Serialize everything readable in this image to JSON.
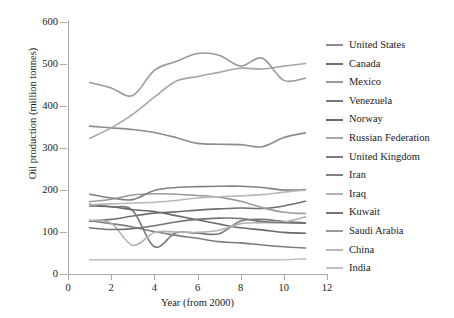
{
  "chart_data": {
    "type": "line",
    "title": "",
    "xlabel": "Year (from 2000)",
    "ylabel": "Oil production (million tonnes)",
    "xlim": [
      0,
      12
    ],
    "ylim": [
      0,
      600
    ],
    "xticks": [
      0,
      2,
      4,
      6,
      8,
      10,
      12
    ],
    "yticks": [
      0,
      100,
      200,
      300,
      400,
      500,
      600
    ],
    "grid": false,
    "legend_position": "right",
    "x": [
      1,
      2,
      3,
      4,
      5,
      6,
      7,
      8,
      9,
      10,
      11
    ],
    "series": [
      {
        "name": "United States",
        "color": "#8c8c8c",
        "values": [
          352,
          348,
          344,
          337,
          325,
          311,
          309,
          308,
          303,
          325,
          336
        ]
      },
      {
        "name": "Canada",
        "color": "#6e6e6e",
        "values": [
          126,
          130,
          138,
          145,
          148,
          152,
          155,
          157,
          156,
          162,
          173
        ]
      },
      {
        "name": "Mexico",
        "color": "#9a9a9a",
        "values": [
          172,
          178,
          188,
          191,
          190,
          187,
          183,
          173,
          158,
          147,
          144
        ]
      },
      {
        "name": "Venezuela",
        "color": "#787878",
        "values": [
          166,
          160,
          151,
          65,
          98,
          97,
          96,
          126,
          130,
          125,
          122
        ]
      },
      {
        "name": "Norway",
        "color": "#6a6a6a",
        "values": [
          162,
          160,
          153,
          149,
          139,
          129,
          119,
          110,
          105,
          99,
          97
        ]
      },
      {
        "name": "Russian Federation",
        "color": "#a6a6a6",
        "values": [
          323,
          348,
          380,
          421,
          459,
          470,
          480,
          490,
          488,
          495,
          501
        ]
      },
      {
        "name": "United Kingdom",
        "color": "#7d7d7d",
        "values": [
          127,
          120,
          112,
          101,
          92,
          85,
          77,
          74,
          69,
          65,
          62
        ]
      },
      {
        "name": "Iran",
        "color": "#808080",
        "values": [
          190,
          181,
          177,
          199,
          206,
          208,
          209,
          209,
          206,
          200,
          201
        ]
      },
      {
        "name": "Iraq",
        "color": "#b2b2b2",
        "values": [
          128,
          121,
          68,
          99,
          100,
          99,
          104,
          120,
          122,
          124,
          136
        ]
      },
      {
        "name": "Kuwait",
        "color": "#747474",
        "values": [
          110,
          106,
          108,
          115,
          124,
          130,
          133,
          132,
          125,
          122,
          121
        ]
      },
      {
        "name": "Saudi Arabia",
        "color": "#999999",
        "values": [
          456,
          443,
          425,
          485,
          506,
          525,
          521,
          495,
          514,
          461,
          466
        ]
      },
      {
        "name": "China",
        "color": "#b8b8b8",
        "values": [
          165,
          167,
          169,
          171,
          175,
          181,
          184,
          186,
          189,
          195,
          200
        ]
      },
      {
        "name": "India",
        "color": "#c0c0c0",
        "values": [
          34,
          34,
          34,
          34,
          34,
          34,
          34,
          34,
          34,
          34,
          36
        ]
      }
    ]
  },
  "legend": {
    "items": [
      {
        "label": "United States"
      },
      {
        "label": "Canada"
      },
      {
        "label": "Mexico"
      },
      {
        "label": "Venezuela"
      },
      {
        "label": "Norway"
      },
      {
        "label": "Russian Federation"
      },
      {
        "label": "United Kingdom"
      },
      {
        "label": "Iran"
      },
      {
        "label": "Iraq"
      },
      {
        "label": "Kuwait"
      },
      {
        "label": "Saudi Arabia"
      },
      {
        "label": "China"
      },
      {
        "label": "India"
      }
    ]
  }
}
